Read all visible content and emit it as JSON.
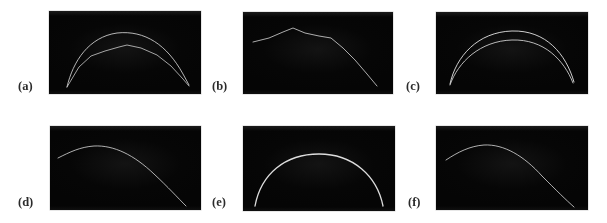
{
  "figure": {
    "background_color": "#ffffff",
    "panel_background_color": "#040404",
    "trace_color": "#e8e8e8",
    "label_color": "#2b2b2b",
    "columns": 3,
    "rows": 2,
    "panel_count": 6
  },
  "panels": [
    {
      "id": "a",
      "label": "(a)",
      "frame": {
        "x": 49,
        "y": 11,
        "w": 152,
        "h": 83
      },
      "label_pos": {
        "x": 18,
        "y": 80
      },
      "curve_count": 2,
      "description": "two faint bright arcs; upper arc peaks higher and is smooth, lower arc is slightly angular with a small cusp near its apex; both converge at the lower-left and lower-right ends"
    },
    {
      "id": "b",
      "label": "(b)",
      "frame": {
        "x": 243,
        "y": 12,
        "w": 150,
        "h": 82
      },
      "label_pos": {
        "x": 212,
        "y": 80
      },
      "curve_count": 1,
      "description": "single piecewise-linear trace rising from mid-left to a peak at about one-third width, then descending steadily and steepening toward the lower right corner"
    },
    {
      "id": "c",
      "label": "(c)",
      "frame": {
        "x": 436,
        "y": 12,
        "w": 152,
        "h": 82
      },
      "label_pos": {
        "x": 406,
        "y": 80
      },
      "curve_count": 2,
      "description": "two smooth nested arcs of similar shape; the inner arc sits just below the outer one, both meeting at the lower-left and lower-right ends"
    },
    {
      "id": "d",
      "label": "(d)",
      "frame": {
        "x": 50,
        "y": 126,
        "w": 151,
        "h": 84
      },
      "label_pos": {
        "x": 18,
        "y": 196
      },
      "curve_count": 1,
      "description": "single smooth trace entering at mid-left, cresting early at about one-third width, then sweeping down to the bottom-right corner"
    },
    {
      "id": "e",
      "label": "(e)",
      "frame": {
        "x": 243,
        "y": 126,
        "w": 152,
        "h": 85
      },
      "label_pos": {
        "x": 212,
        "y": 196
      },
      "curve_count": 1,
      "description": "single bright symmetric dome arc spanning nearly the full width, apex near the horizontal centre"
    },
    {
      "id": "f",
      "label": "(f)",
      "frame": {
        "x": 436,
        "y": 126,
        "w": 152,
        "h": 84
      },
      "label_pos": {
        "x": 408,
        "y": 196
      },
      "curve_count": 1,
      "description": "single smooth trace entering at mid-left, cresting at about one-third width, then descending to the bottom-right corner"
    }
  ]
}
